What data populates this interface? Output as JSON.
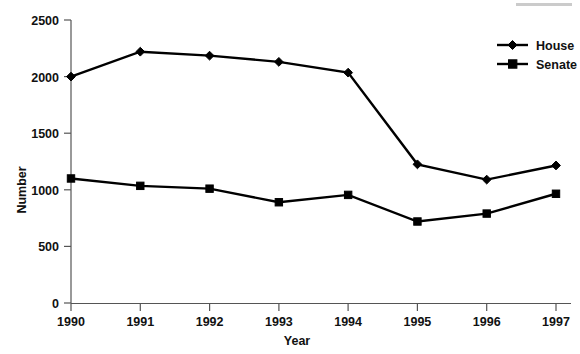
{
  "chart_data": {
    "type": "line",
    "title": "",
    "xlabel": "Year",
    "ylabel": "Number",
    "categories": [
      "1990",
      "1991",
      "1992",
      "1993",
      "1994",
      "1995",
      "1996",
      "1997"
    ],
    "x": [
      1990,
      1991,
      1992,
      1993,
      1994,
      1995,
      1996,
      1997
    ],
    "series": [
      {
        "name": "House",
        "marker": "diamond",
        "color": "#000000",
        "values": [
          2000,
          2220,
          2185,
          2130,
          2035,
          1225,
          1090,
          1215
        ]
      },
      {
        "name": "Senate",
        "marker": "square",
        "color": "#000000",
        "values": [
          1100,
          1035,
          1010,
          890,
          955,
          720,
          790,
          965
        ]
      }
    ],
    "ylim": [
      0,
      2500
    ],
    "yticks": [
      0,
      500,
      1000,
      1500,
      2000,
      2500
    ],
    "ytick_labels": [
      "0",
      "500",
      "1000",
      "1500",
      "2000",
      "2500"
    ],
    "xtick_labels": [
      "1990",
      "1991",
      "1992",
      "1993",
      "1994",
      "1995",
      "1996",
      "1997"
    ],
    "grid": false,
    "legend_position": "top-right",
    "legend_entries": [
      "House",
      "Senate"
    ]
  },
  "axes": {
    "y_title": "Number",
    "x_title": "Year"
  },
  "legend": {
    "items": [
      {
        "label": "House",
        "marker": "diamond-marker"
      },
      {
        "label": "Senate",
        "marker": "square-marker"
      }
    ]
  }
}
